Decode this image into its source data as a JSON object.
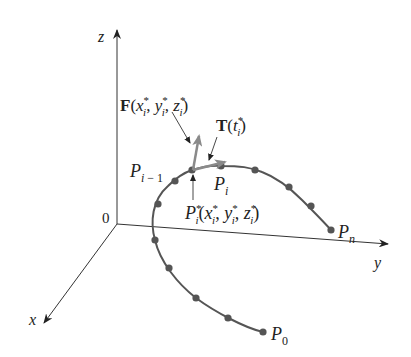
{
  "diagram": {
    "axes": {
      "origin_label": "0",
      "x_label": "x",
      "y_label": "y",
      "z_label": "z"
    },
    "labels": {
      "force_F": "F",
      "force_args": "(x",
      "tangent_T": "T",
      "P_i_minus_1": "P",
      "P_i": "P",
      "P_star": "P",
      "P_n": "P",
      "P_0": "P"
    },
    "text": {
      "force": "F(xi*, yi*, zi*)",
      "tangent": "T(ti*)",
      "point_prev": "Pi−1",
      "point_i": "Pi",
      "sample_point": "Pi*(xi*, yi*, zi*)",
      "end_point": "Pn",
      "start_point": "P0"
    },
    "colors": {
      "axis": "#333333",
      "curve": "#555555",
      "vector": "#8a8a8a",
      "text": "#222222"
    }
  }
}
